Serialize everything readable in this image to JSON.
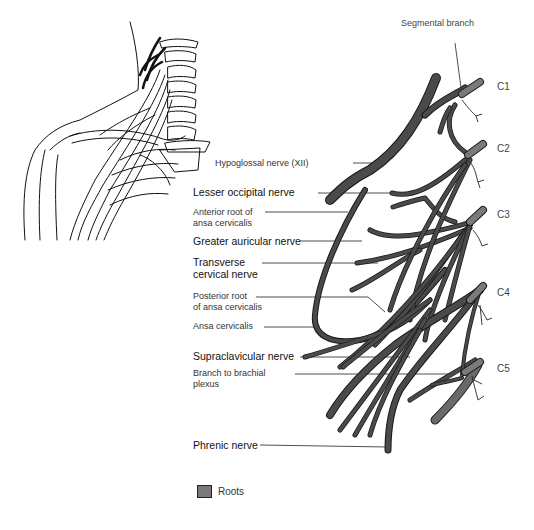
{
  "diagram": {
    "labels_left": [
      {
        "id": "hypoglossal",
        "text": "Hypoglossal nerve (XII)",
        "emphasis": false
      },
      {
        "id": "lesser-occipital",
        "text": "Lesser occipital nerve",
        "emphasis": true
      },
      {
        "id": "anterior-root-1",
        "text": "Anterior root of",
        "emphasis": false
      },
      {
        "id": "anterior-root-2",
        "text": "ansa cervicalis",
        "emphasis": false
      },
      {
        "id": "greater-auricular",
        "text": "Greater auricular nerve",
        "emphasis": true
      },
      {
        "id": "transverse-1",
        "text": "Transverse",
        "emphasis": true
      },
      {
        "id": "transverse-2",
        "text": "cervical nerve",
        "emphasis": true
      },
      {
        "id": "posterior-root-1",
        "text": "Posterior root",
        "emphasis": false
      },
      {
        "id": "posterior-root-2",
        "text": "of ansa cervicalis",
        "emphasis": false
      },
      {
        "id": "ansa",
        "text": "Ansa cervicalis",
        "emphasis": false
      },
      {
        "id": "supraclavicular",
        "text": "Supraclavicular nerve",
        "emphasis": true
      },
      {
        "id": "brachial-1",
        "text": "Branch to brachial",
        "emphasis": false
      },
      {
        "id": "brachial-2",
        "text": "plexus",
        "emphasis": false
      },
      {
        "id": "phrenic",
        "text": "Phrenic nerve",
        "emphasis": true
      }
    ],
    "segmental_branch": "Segmental branch",
    "roots": [
      "C1",
      "C2",
      "C3",
      "C4",
      "C5"
    ],
    "legend": {
      "label": "Roots",
      "color": "#7a7a7a"
    },
    "colors": {
      "nerve": "#4a4a4a",
      "root": "#7a7a7a",
      "outline": "#1a1a1a"
    }
  }
}
